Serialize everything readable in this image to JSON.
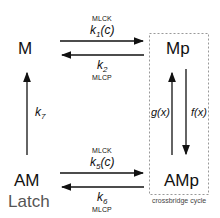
{
  "states": {
    "M": "M",
    "Mp": "Mp",
    "AM": "AM",
    "AMp": "AMp"
  },
  "latch_label": "Latch",
  "crossbridge_label": "crossbridge cycle",
  "transitions": {
    "k1": {
      "enzyme": "MLCK",
      "rate": "k",
      "sub": "1",
      "arg": "(c)"
    },
    "k2": {
      "enzyme": "MLCP",
      "rate": "k",
      "sub": "2",
      "arg": ""
    },
    "k5": {
      "enzyme": "MLCK",
      "rate": "k",
      "sub": "5",
      "arg": "(c)"
    },
    "k6": {
      "enzyme": "MLCP",
      "rate": "k",
      "sub": "6",
      "arg": ""
    },
    "k7": {
      "rate": "k",
      "sub": "7"
    },
    "g": {
      "label": "g(x)"
    },
    "f": {
      "label": "f(x)"
    }
  }
}
